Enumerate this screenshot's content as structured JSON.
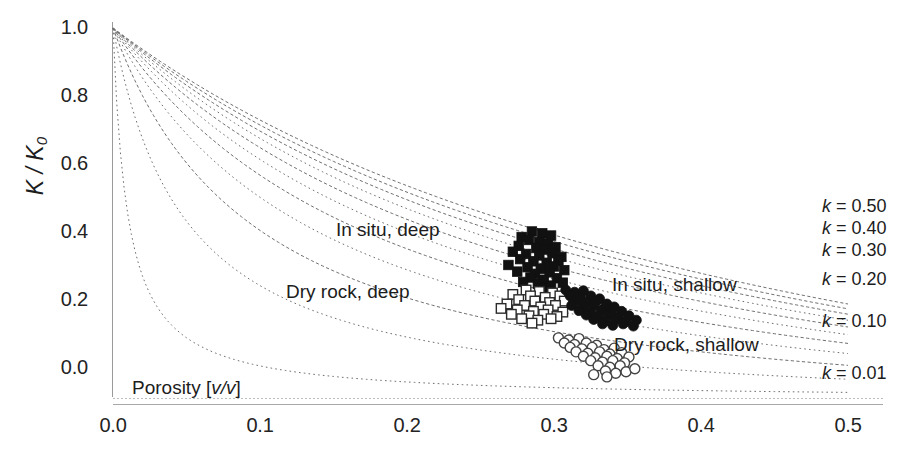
{
  "chart_data": {
    "type": "line",
    "title": "",
    "xlabel": "Porosity [v/v]",
    "ylabel": "K / K0",
    "ylabel_main": "K / K",
    "ylabel_sub": "0",
    "xlim": [
      0.0,
      0.5
    ],
    "ylim": [
      0.0,
      1.0
    ],
    "grid": false,
    "legend_position": "right-inline",
    "xticks": [
      "0.0",
      "0.1",
      "0.2",
      "0.3",
      "0.4",
      "0.5"
    ],
    "xtick_values": [
      0.0,
      0.1,
      0.2,
      0.3,
      0.4,
      0.5
    ],
    "yticks": [
      "0.0",
      "0.2",
      "0.4",
      "0.6",
      "0.8",
      "1.0"
    ],
    "ytick_values": [
      0.0,
      0.2,
      0.4,
      0.6,
      0.8,
      1.0
    ],
    "curve_formula": "K/K0 = (1 - phi) / (1 + phi/k)",
    "series": [
      {
        "name": "k = 0.50",
        "k": 0.5,
        "labeled": true,
        "style": "dashed",
        "label_y": 205
      },
      {
        "name": "k = 0.45",
        "k": 0.45,
        "labeled": false,
        "style": "dashed",
        "label_y": null
      },
      {
        "name": "k = 0.40",
        "k": 0.4,
        "labeled": true,
        "style": "dashed",
        "label_y": 227
      },
      {
        "name": "k = 0.35",
        "k": 0.35,
        "labeled": false,
        "style": "dotted",
        "label_y": null
      },
      {
        "name": "k = 0.30",
        "k": 0.3,
        "labeled": true,
        "style": "dashed",
        "label_y": 249
      },
      {
        "name": "k = 0.25",
        "k": 0.25,
        "labeled": false,
        "style": "dotted",
        "label_y": null
      },
      {
        "name": "k = 0.20",
        "k": 0.2,
        "labeled": true,
        "style": "dashed",
        "label_y": 278
      },
      {
        "name": "k = 0.15",
        "k": 0.15,
        "labeled": false,
        "style": "dotted",
        "label_y": null
      },
      {
        "name": "k = 0.10",
        "k": 0.1,
        "labeled": true,
        "style": "dashed",
        "label_y": 320
      },
      {
        "name": "k = 0.05",
        "k": 0.05,
        "labeled": false,
        "style": "dotted",
        "label_y": null
      },
      {
        "name": "k = 0.01",
        "k": 0.01,
        "labeled": true,
        "style": "dotted",
        "label_y": 372
      }
    ],
    "k_labels": [
      "k = 0.50",
      "k = 0.40",
      "k = 0.30",
      "k = 0.20",
      "k = 0.10",
      "k = 0.01"
    ],
    "k_label_values": [
      0.5,
      0.4,
      0.3,
      0.2,
      0.1,
      0.01
    ],
    "scatter_groups": [
      {
        "name": "In situ, deep",
        "marker": "filled-square",
        "color": "#111111",
        "annotation": "In situ, deep",
        "annotation_x": 336,
        "annotation_y": 219,
        "points": [
          [
            0.278,
            0.432
          ],
          [
            0.285,
            0.447
          ],
          [
            0.292,
            0.442
          ],
          [
            0.298,
            0.436
          ],
          [
            0.283,
            0.424
          ],
          [
            0.29,
            0.418
          ],
          [
            0.296,
            0.414
          ],
          [
            0.276,
            0.408
          ],
          [
            0.288,
            0.402
          ],
          [
            0.294,
            0.398
          ],
          [
            0.301,
            0.404
          ],
          [
            0.272,
            0.392
          ],
          [
            0.281,
            0.386
          ],
          [
            0.29,
            0.382
          ],
          [
            0.299,
            0.388
          ],
          [
            0.305,
            0.378
          ],
          [
            0.277,
            0.372
          ],
          [
            0.286,
            0.366
          ],
          [
            0.295,
            0.362
          ],
          [
            0.303,
            0.368
          ],
          [
            0.269,
            0.356
          ],
          [
            0.282,
            0.35
          ],
          [
            0.291,
            0.346
          ],
          [
            0.3,
            0.352
          ],
          [
            0.307,
            0.342
          ],
          [
            0.275,
            0.338
          ],
          [
            0.287,
            0.332
          ],
          [
            0.297,
            0.336
          ],
          [
            0.284,
            0.322
          ],
          [
            0.293,
            0.316
          ],
          [
            0.302,
            0.32
          ],
          [
            0.279,
            0.31
          ],
          [
            0.289,
            0.305
          ],
          [
            0.298,
            0.3
          ],
          [
            0.306,
            0.308
          ],
          [
            0.292,
            0.294
          ]
        ]
      },
      {
        "name": "Dry rock, deep",
        "marker": "open-square",
        "color": "#2b2b2b",
        "annotation": "Dry rock, deep",
        "annotation_x": 286,
        "annotation_y": 281,
        "points": [
          [
            0.281,
            0.288
          ],
          [
            0.29,
            0.284
          ],
          [
            0.299,
            0.28
          ],
          [
            0.272,
            0.276
          ],
          [
            0.284,
            0.272
          ],
          [
            0.294,
            0.268
          ],
          [
            0.304,
            0.272
          ],
          [
            0.276,
            0.262
          ],
          [
            0.287,
            0.258
          ],
          [
            0.297,
            0.254
          ],
          [
            0.307,
            0.258
          ],
          [
            0.268,
            0.25
          ],
          [
            0.28,
            0.246
          ],
          [
            0.291,
            0.242
          ],
          [
            0.301,
            0.246
          ],
          [
            0.264,
            0.238
          ],
          [
            0.275,
            0.234
          ],
          [
            0.286,
            0.23
          ],
          [
            0.296,
            0.234
          ],
          [
            0.306,
            0.228
          ],
          [
            0.271,
            0.222
          ],
          [
            0.283,
            0.218
          ],
          [
            0.293,
            0.222
          ],
          [
            0.302,
            0.216
          ],
          [
            0.278,
            0.21
          ],
          [
            0.289,
            0.206
          ],
          [
            0.298,
            0.21
          ],
          [
            0.285,
            0.198
          ]
        ]
      },
      {
        "name": "In situ, shallow",
        "marker": "filled-circle",
        "color": "#111111",
        "annotation": "In situ, shallow",
        "annotation_x": 612,
        "annotation_y": 274,
        "points": [
          [
            0.308,
            0.288
          ],
          [
            0.314,
            0.282
          ],
          [
            0.32,
            0.286
          ],
          [
            0.311,
            0.272
          ],
          [
            0.318,
            0.268
          ],
          [
            0.325,
            0.272
          ],
          [
            0.331,
            0.264
          ],
          [
            0.315,
            0.258
          ],
          [
            0.322,
            0.254
          ],
          [
            0.329,
            0.258
          ],
          [
            0.336,
            0.25
          ],
          [
            0.312,
            0.246
          ],
          [
            0.32,
            0.242
          ],
          [
            0.327,
            0.246
          ],
          [
            0.334,
            0.238
          ],
          [
            0.341,
            0.242
          ],
          [
            0.317,
            0.232
          ],
          [
            0.325,
            0.228
          ],
          [
            0.332,
            0.232
          ],
          [
            0.339,
            0.226
          ],
          [
            0.346,
            0.23
          ],
          [
            0.322,
            0.22
          ],
          [
            0.33,
            0.216
          ],
          [
            0.337,
            0.22
          ],
          [
            0.344,
            0.214
          ],
          [
            0.351,
            0.218
          ],
          [
            0.327,
            0.208
          ],
          [
            0.335,
            0.204
          ],
          [
            0.342,
            0.208
          ],
          [
            0.349,
            0.202
          ],
          [
            0.356,
            0.206
          ],
          [
            0.333,
            0.196
          ],
          [
            0.34,
            0.192
          ],
          [
            0.347,
            0.196
          ],
          [
            0.354,
            0.19
          ]
        ]
      },
      {
        "name": "Dry rock, shallow",
        "marker": "open-circle",
        "color": "#444444",
        "annotation": "Dry rock, shallow",
        "annotation_x": 614,
        "annotation_y": 334,
        "points": [
          [
            0.303,
            0.158
          ],
          [
            0.31,
            0.152
          ],
          [
            0.317,
            0.156
          ],
          [
            0.307,
            0.144
          ],
          [
            0.314,
            0.14
          ],
          [
            0.322,
            0.144
          ],
          [
            0.329,
            0.138
          ],
          [
            0.311,
            0.132
          ],
          [
            0.319,
            0.128
          ],
          [
            0.326,
            0.132
          ],
          [
            0.334,
            0.126
          ],
          [
            0.341,
            0.13
          ],
          [
            0.315,
            0.12
          ],
          [
            0.323,
            0.116
          ],
          [
            0.331,
            0.12
          ],
          [
            0.338,
            0.114
          ],
          [
            0.346,
            0.118
          ],
          [
            0.32,
            0.108
          ],
          [
            0.328,
            0.104
          ],
          [
            0.336,
            0.108
          ],
          [
            0.343,
            0.102
          ],
          [
            0.351,
            0.106
          ],
          [
            0.325,
            0.096
          ],
          [
            0.333,
            0.092
          ],
          [
            0.34,
            0.096
          ],
          [
            0.348,
            0.09
          ],
          [
            0.33,
            0.082
          ],
          [
            0.338,
            0.078
          ],
          [
            0.345,
            0.082
          ],
          [
            0.335,
            0.068
          ],
          [
            0.342,
            0.062
          ],
          [
            0.349,
            0.066
          ],
          [
            0.355,
            0.074
          ],
          [
            0.327,
            0.058
          ],
          [
            0.336,
            0.052
          ]
        ]
      }
    ]
  },
  "axes": {
    "y_ticks": [
      {
        "label": "1.0"
      },
      {
        "label": "0.8"
      },
      {
        "label": "0.6"
      },
      {
        "label": "0.4"
      },
      {
        "label": "0.2"
      },
      {
        "label": "0.0"
      }
    ],
    "x_ticks": [
      {
        "label": "0.0"
      },
      {
        "label": "0.1"
      },
      {
        "label": "0.2"
      },
      {
        "label": "0.3"
      },
      {
        "label": "0.4"
      },
      {
        "label": "0.5"
      }
    ],
    "x_axis_title": "Porosity [",
    "x_axis_title_italic": "v/v",
    "x_axis_title_tail": "]",
    "y_axis_title": "K / K",
    "y_axis_title_sub": "0"
  },
  "annotations": {
    "in_situ_deep": "In situ, deep",
    "dry_rock_deep": "Dry rock, deep",
    "in_situ_shallow": "In situ, shallow",
    "dry_rock_shallow": "Dry rock, shallow"
  },
  "legend": {
    "items": [
      {
        "text": "k = 0.50",
        "k_sym": "k",
        "eq": "= 0.50"
      },
      {
        "text": "k = 0.40",
        "k_sym": "k",
        "eq": "= 0.40"
      },
      {
        "text": "k = 0.30",
        "k_sym": "k",
        "eq": "= 0.30"
      },
      {
        "text": "k = 0.20",
        "k_sym": "k",
        "eq": "= 0.20"
      },
      {
        "text": "k = 0.10",
        "k_sym": "k",
        "eq": "= 0.10"
      },
      {
        "text": "k = 0.01",
        "k_sym": "k",
        "eq": "= 0.01"
      }
    ]
  }
}
